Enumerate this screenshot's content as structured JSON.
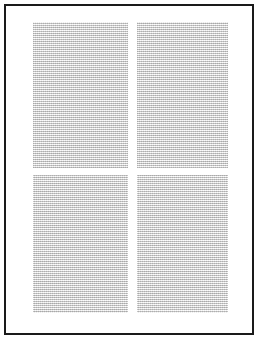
{
  "document": {
    "title": "Scanned document page",
    "media": "scanned-page-image",
    "page_background_color": "#ffffff",
    "frame": {
      "name": "page border",
      "color": "#1a1a1a",
      "thickness_px": 2,
      "left_px": 4,
      "top_px": 4,
      "width_px": 250,
      "height_px": 331
    },
    "layout": {
      "description": "Two-column text layout split into upper and lower halves, four grey text blocks total",
      "columns": 2,
      "rows": 2,
      "block_count": 4
    },
    "blocks": [
      {
        "id": "top-left",
        "position": "top-left",
        "column": 1,
        "row": 1,
        "left_px": 33,
        "top_px": 22,
        "width_px": 95,
        "height_px": 146,
        "fill_color": "#dedede",
        "content": "",
        "legible": "no"
      },
      {
        "id": "top-right",
        "position": "top-right",
        "column": 2,
        "row": 1,
        "left_px": 137,
        "top_px": 22,
        "width_px": 91,
        "height_px": 146,
        "fill_color": "#dedede",
        "content": "",
        "legible": "no"
      },
      {
        "id": "bottom-left",
        "position": "bottom-left",
        "column": 1,
        "row": 2,
        "left_px": 33,
        "top_px": 175,
        "width_px": 95,
        "height_px": 138,
        "fill_color": "#dedede",
        "content": "",
        "legible": "no"
      },
      {
        "id": "bottom-right",
        "position": "bottom-right",
        "column": 2,
        "row": 2,
        "left_px": 137,
        "top_px": 175,
        "width_px": 91,
        "height_px": 138,
        "fill_color": "#dedede",
        "content": "",
        "legible": "no"
      }
    ]
  }
}
